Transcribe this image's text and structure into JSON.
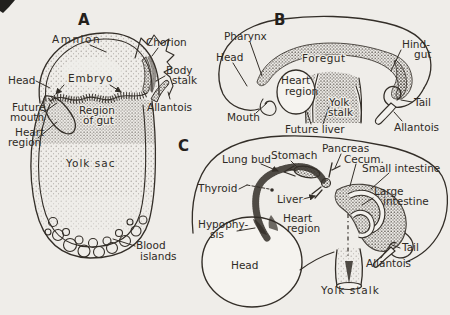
{
  "colors": {
    "paper": "#efede9",
    "ink": "#332e28"
  },
  "panels": [
    {
      "letter": "A",
      "labels": [
        {
          "name": "amnion",
          "lines": [
            "Amnion"
          ]
        },
        {
          "name": "chorion",
          "lines": [
            "Chorion"
          ]
        },
        {
          "name": "head",
          "lines": [
            "Head"
          ]
        },
        {
          "name": "embryo",
          "lines": [
            "Embryo"
          ]
        },
        {
          "name": "body-stalk",
          "lines": [
            "Body",
            "stalk"
          ]
        },
        {
          "name": "future-mouth",
          "lines": [
            "Future",
            "mouth"
          ]
        },
        {
          "name": "region-of-gut",
          "lines": [
            "Region",
            "of gut"
          ]
        },
        {
          "name": "allantois",
          "lines": [
            "Allantois"
          ]
        },
        {
          "name": "heart-region",
          "lines": [
            "Heart",
            "region"
          ]
        },
        {
          "name": "yolk-sac",
          "lines": [
            "Yolk sac"
          ]
        },
        {
          "name": "blood-islands",
          "lines": [
            "Blood",
            "islands"
          ]
        }
      ]
    },
    {
      "letter": "B",
      "labels": [
        {
          "name": "pharynx",
          "lines": [
            "Pharynx"
          ]
        },
        {
          "name": "head",
          "lines": [
            "Head"
          ]
        },
        {
          "name": "foregut",
          "lines": [
            "Foregut"
          ]
        },
        {
          "name": "hind-gut",
          "lines": [
            "Hind-",
            "gut"
          ]
        },
        {
          "name": "heart-region",
          "lines": [
            "Heart",
            "region"
          ]
        },
        {
          "name": "mouth",
          "lines": [
            "Mouth"
          ]
        },
        {
          "name": "yolk-stalk",
          "lines": [
            "Yolk",
            "stalk"
          ]
        },
        {
          "name": "future-liver",
          "lines": [
            "Future liver"
          ]
        },
        {
          "name": "tail",
          "lines": [
            "Tail"
          ]
        },
        {
          "name": "allantois",
          "lines": [
            "Allantois"
          ]
        }
      ]
    },
    {
      "letter": "C",
      "labels": [
        {
          "name": "lung-bud",
          "lines": [
            "Lung bud"
          ]
        },
        {
          "name": "stomach",
          "lines": [
            "Stomach"
          ]
        },
        {
          "name": "pancreas",
          "lines": [
            "Pancreas"
          ]
        },
        {
          "name": "cecum",
          "lines": [
            "Cecum."
          ]
        },
        {
          "name": "small-intestine",
          "lines": [
            "Small intestine"
          ]
        },
        {
          "name": "thyroid",
          "lines": [
            "Thyroid"
          ]
        },
        {
          "name": "liver",
          "lines": [
            "Liver"
          ]
        },
        {
          "name": "large-intestine",
          "lines": [
            "Large",
            "intestine"
          ]
        },
        {
          "name": "heart-region",
          "lines": [
            "Heart",
            "region"
          ]
        },
        {
          "name": "hypophysis",
          "lines": [
            "Hypophy-",
            "sis"
          ]
        },
        {
          "name": "head",
          "lines": [
            "Head"
          ]
        },
        {
          "name": "tail",
          "lines": [
            "Tail"
          ]
        },
        {
          "name": "allantois",
          "lines": [
            "Allantois"
          ]
        },
        {
          "name": "yolk-stalk",
          "lines": [
            "Yolk stalk"
          ]
        }
      ]
    }
  ]
}
